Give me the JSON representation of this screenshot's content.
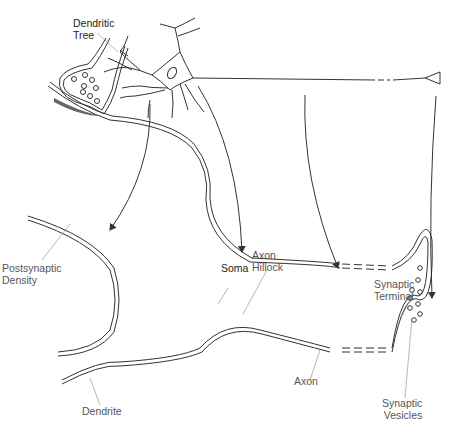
{
  "diagram": {
    "labels": {
      "dendritic_tree": [
        "Dendritic",
        "Tree"
      ],
      "postsynaptic_density": [
        "Postsynaptic",
        "Density"
      ],
      "soma": "Soma",
      "axon_hillock": [
        "Axon",
        "Hillock"
      ],
      "synaptic_terminal": [
        "Synaptic",
        "Terminal"
      ],
      "axon": "Axon",
      "dendrite": "Dendrite",
      "synaptic_vesicles": [
        "Synaptic",
        "Vesicles"
      ]
    },
    "colors": {
      "line": "#333333",
      "label": "#555555",
      "density": "#666666"
    }
  }
}
